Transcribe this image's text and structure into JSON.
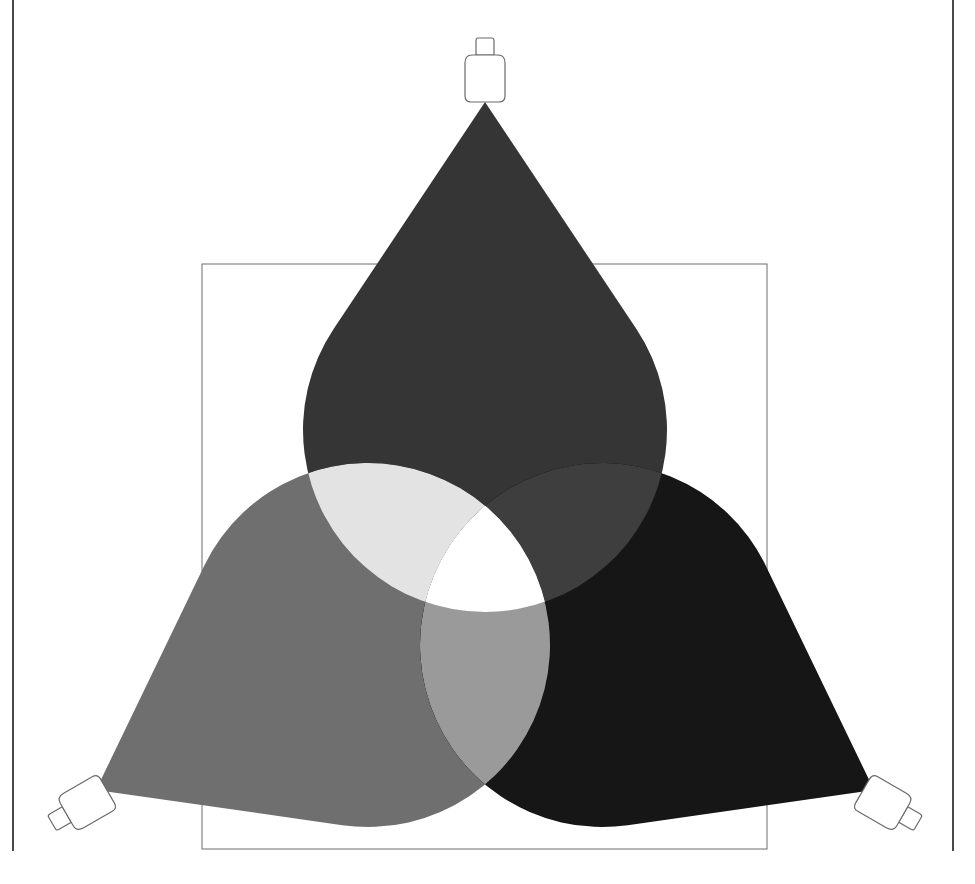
{
  "figure": {
    "title": "Three overlapping light beams",
    "frame": {
      "x": 202,
      "y": 264,
      "width": 565,
      "height": 585,
      "stroke": "#6c6c6c"
    },
    "page_rules": [
      {
        "x": 13
      },
      {
        "x": 953
      }
    ],
    "beams": [
      {
        "id": "top",
        "lamp": {
          "x": 485,
          "y": 68,
          "angle": 0
        },
        "apex": [
          485,
          102
        ],
        "circle": {
          "cx": 485,
          "cy": 430,
          "r": 182
        },
        "fill": "#353535"
      },
      {
        "id": "left",
        "lamp": {
          "x": 78,
          "y": 808,
          "angle": -120
        },
        "apex": [
          96,
          790
        ],
        "circle": {
          "cx": 368,
          "cy": 645,
          "r": 182
        },
        "fill": "#6f6f6f"
      },
      {
        "id": "right",
        "lamp": {
          "x": 892,
          "y": 808,
          "angle": 120
        },
        "apex": [
          874,
          790
        ],
        "circle": {
          "cx": 602,
          "cy": 645,
          "r": 182
        },
        "fill": "#161616"
      }
    ],
    "overlaps": {
      "top_left": "#e3e3e3",
      "top_right": "#3e3e3e",
      "left_right": "#9a9a9a",
      "all": "#ffffff"
    }
  }
}
